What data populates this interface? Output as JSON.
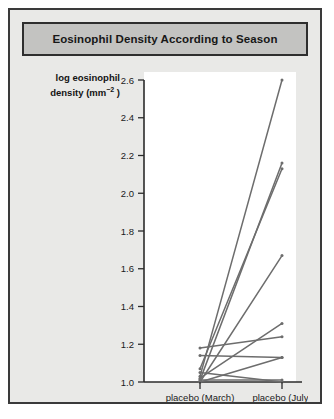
{
  "figure": {
    "title": "Eosinophil Density According to Season",
    "background_color": "#e9e9e7",
    "title_bar_color": "#c3c3c1",
    "border_color": "#3a3a3a"
  },
  "chart_data": {
    "type": "line",
    "title": "Eosinophil Density According to Season",
    "xlabel": "",
    "ylabel": "log eosinophil density (mm−2)",
    "ylabel_line1": "log eosinophil",
    "ylabel_line2_pre": "density (mm",
    "ylabel_line2_sup": "−2",
    "ylabel_line2_post": " )",
    "categories": [
      "placebo (March)",
      "placebo (July)"
    ],
    "x": [
      "placebo (March)",
      "placebo (July)"
    ],
    "ylim": [
      1.0,
      2.6
    ],
    "yticks": [
      1.0,
      1.2,
      1.4,
      1.6,
      1.8,
      2.0,
      2.2,
      2.4,
      2.6
    ],
    "ytick_labels": [
      "1.0",
      "1.2",
      "1.4",
      "1.6",
      "1.8",
      "2.0",
      "2.2",
      "2.4",
      "2.6"
    ],
    "grid": false,
    "legend": "none",
    "line_color": "#6d6d6d",
    "marker": "dot",
    "note": "Paired before-after plot: each line connects one subject's March value to their July value.",
    "series": [
      {
        "name": "subject-1",
        "values": [
          1.03,
          2.6
        ]
      },
      {
        "name": "subject-2",
        "values": [
          1.01,
          2.16
        ]
      },
      {
        "name": "subject-3",
        "values": [
          1.07,
          2.13
        ]
      },
      {
        "name": "subject-4",
        "values": [
          1.0,
          1.67
        ]
      },
      {
        "name": "subject-5",
        "values": [
          1.02,
          1.31
        ]
      },
      {
        "name": "subject-6",
        "values": [
          1.18,
          1.24
        ]
      },
      {
        "name": "subject-7",
        "values": [
          1.14,
          1.13
        ]
      },
      {
        "name": "subject-8",
        "values": [
          1.0,
          1.13
        ]
      },
      {
        "name": "subject-9",
        "values": [
          1.01,
          1.01
        ]
      },
      {
        "name": "subject-10",
        "values": [
          1.05,
          1.0
        ]
      }
    ]
  }
}
